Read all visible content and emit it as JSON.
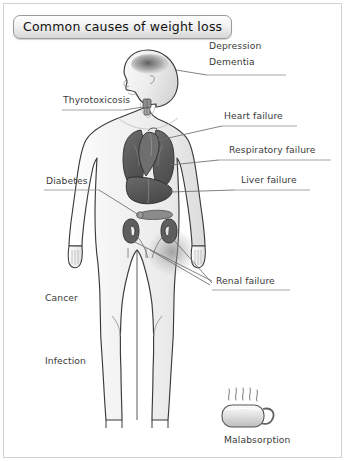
{
  "figure": {
    "title": "Common causes of weight loss",
    "colors": {
      "border": "#d2d2d2",
      "body_outline": "#3a3a3a",
      "body_fill": "#f2f2f2",
      "organ_dark": "#5a5a5a",
      "organ_mid": "#6e6e6e",
      "leader_line": "#6b6b6b",
      "text": "#3b3b3b",
      "brain_shade": "#6a6a6a"
    }
  },
  "labels": {
    "depression": "Depression",
    "dementia": "Dementia",
    "thyrotoxicosis": "Thyrotoxicosis",
    "heart_failure": "Heart failure",
    "respiratory_failure": "Respiratory failure",
    "diabetes": "Diabetes",
    "liver_failure": "Liver failure",
    "renal_failure": "Renal failure",
    "cancer": "Cancer",
    "infection": "Infection",
    "malabsorption": "Malabsorption"
  },
  "icons": {
    "body_figure": "human-body-figure",
    "head": "head-profile",
    "brain": "brain-shading",
    "thyroid": "thyroid-gland",
    "lungs": "lungs",
    "heart": "heart",
    "liver": "liver",
    "kidneys": "kidneys",
    "pancreas": "pancreas",
    "mug": "steaming-mug"
  }
}
